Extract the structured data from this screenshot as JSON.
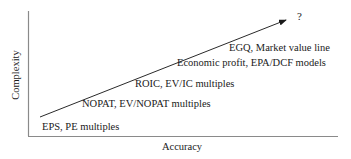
{
  "diagram": {
    "type": "conceptual-axis-diagram",
    "x_axis_label": "Accuracy",
    "y_axis_label": "Complexity",
    "arrow_end_label": "?",
    "levels": [
      {
        "label": "EPS, PE multiples"
      },
      {
        "label": "NOPAT, EV/NOPAT multiples"
      },
      {
        "label": "ROIC, EV/IC multiples"
      },
      {
        "label": "Economic profit, EPA/DCF models"
      },
      {
        "label": "EGQ, Market value line"
      }
    ],
    "colors": {
      "axis": "#8a8a8a",
      "arrow": "#2a2a2a",
      "text": "#1a1a1a",
      "background": "#ffffff"
    }
  }
}
